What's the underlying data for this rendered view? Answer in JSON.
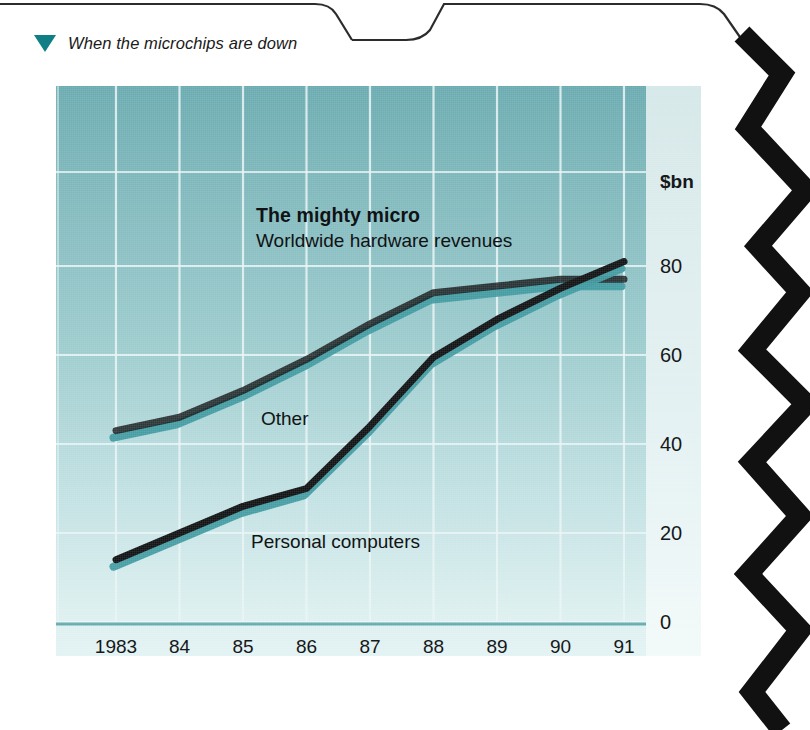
{
  "header": {
    "marker_icon": "triangle-down-icon",
    "title": "When the microchips are down",
    "marker_color": "#0f7f85"
  },
  "figure": {
    "panel_top_color": "#6aabb0",
    "panel_bottom_color": "#e3f2f2",
    "gridline_color": "#eaf5f6",
    "series_line_color": "#111315",
    "series_shadow_color": "#3f9aa0"
  },
  "chart_data": {
    "type": "line",
    "title": "The mighty micro",
    "subtitle": "Worldwide hardware revenues",
    "xlabel": "",
    "ylabel": "$bn",
    "unit_label": "$bn",
    "categories": [
      "1983",
      "84",
      "85",
      "86",
      "87",
      "88",
      "89",
      "90",
      "91"
    ],
    "x_tick_labels": [
      "1983",
      "84",
      "85",
      "86",
      "87",
      "88",
      "89",
      "90",
      "91"
    ],
    "y_tick_labels": [
      "80",
      "60",
      "40",
      "20",
      "0"
    ],
    "y_ticks": [
      80,
      60,
      40,
      20,
      0
    ],
    "ylim": [
      0,
      88
    ],
    "xlim": [
      1983,
      1991
    ],
    "grid": true,
    "legend_position": "inline-labels",
    "series": [
      {
        "name": "Other",
        "label": "Other",
        "values": [
          43,
          46,
          52,
          59,
          67,
          74,
          75.5,
          77,
          77
        ]
      },
      {
        "name": "Personal computers",
        "label": "Personal computers",
        "values": [
          14,
          20,
          26,
          30,
          44,
          59.5,
          68,
          75,
          81
        ]
      }
    ],
    "annotations": [
      {
        "text": "Other",
        "x": 1985.6,
        "y": 50
      },
      {
        "text": "Personal computers",
        "x": 1985.4,
        "y": 24
      }
    ]
  }
}
